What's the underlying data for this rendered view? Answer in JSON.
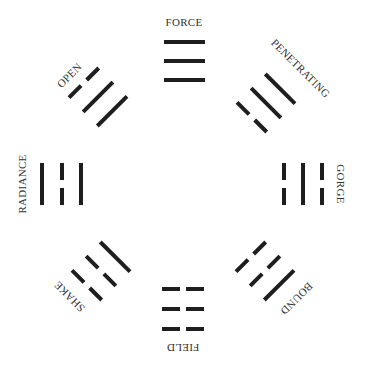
{
  "diagram": {
    "colors": {
      "line": "#1e1e1e",
      "text": "#333333",
      "background": "#ffffff"
    },
    "trigrams": [
      {
        "id": "force",
        "label": "FORCE",
        "position": "top",
        "lines": [
          "solid",
          "solid",
          "solid"
        ]
      },
      {
        "id": "penetrating",
        "label": "PENETRATING",
        "position": "top-right",
        "lines": [
          "solid",
          "solid",
          "broken"
        ]
      },
      {
        "id": "gorge",
        "label": "GORGE",
        "position": "right",
        "lines": [
          "broken",
          "solid",
          "broken"
        ]
      },
      {
        "id": "bound",
        "label": "BOUND",
        "position": "bottom-right",
        "lines": [
          "solid",
          "broken",
          "broken"
        ]
      },
      {
        "id": "field",
        "label": "FIELD",
        "position": "bottom",
        "lines": [
          "broken",
          "broken",
          "broken"
        ]
      },
      {
        "id": "shake",
        "label": "SHAKE",
        "position": "bottom-left",
        "lines": [
          "broken",
          "broken",
          "solid"
        ]
      },
      {
        "id": "radiance",
        "label": "RADIANCE",
        "position": "left",
        "lines": [
          "solid",
          "broken",
          "solid"
        ]
      },
      {
        "id": "open",
        "label": "OPEN",
        "position": "top-left",
        "lines": [
          "broken",
          "solid",
          "solid"
        ]
      }
    ]
  }
}
